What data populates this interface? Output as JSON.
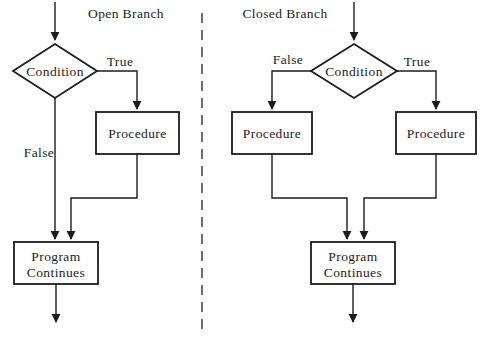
{
  "page": {
    "background": "#ffffff"
  },
  "diagram": {
    "colors": {
      "line": "#1c1c1c",
      "divider": "#4d4d4d",
      "node_fill": "#ffffff"
    },
    "open_branch": {
      "title": "Open Branch",
      "condition_label": "Condition",
      "true_label": "True",
      "false_label": "False",
      "procedure_label": "Procedure",
      "program_label": [
        "Program",
        "Continues"
      ]
    },
    "closed_branch": {
      "title": "Closed Branch",
      "condition_label": "Condition",
      "true_label": "True",
      "false_label": "False",
      "procedure_left_label": "Procedure",
      "procedure_right_label": "Procedure",
      "program_label": [
        "Program",
        "Continues"
      ]
    }
  }
}
